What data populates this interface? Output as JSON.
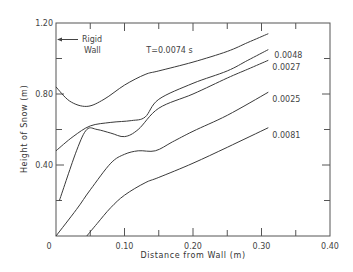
{
  "chart_data": {
    "type": "line",
    "title": "",
    "xlabel": "Distance from Wall (m)",
    "ylabel": "Height of Snow (m)",
    "xlim": [
      0,
      0.4
    ],
    "ylim": [
      0,
      1.2
    ],
    "x_ticks": [
      0,
      0.1,
      0.2,
      0.3,
      0.4
    ],
    "x_tick_labels": [
      "0",
      "0.10",
      "0.20",
      "0.30",
      "0.40"
    ],
    "x_minor_ticks": [
      0.05,
      0.15,
      0.25,
      0.35
    ],
    "y_ticks": [
      0.4,
      0.8,
      1.2
    ],
    "y_tick_labels": [
      "0.40",
      "0.80",
      "1.20"
    ],
    "y_minor_ticks": [
      0.2,
      0.6,
      1.0
    ],
    "grid": false,
    "annotations": [
      {
        "text_line1": "Rigid",
        "text_line2": "Wall",
        "arrow": "left",
        "points_to": "y-axis"
      }
    ],
    "series": [
      {
        "name": "T=0.0074 s",
        "label": "T=0.0074 s",
        "x": [
          0,
          0.02,
          0.045,
          0.07,
          0.1,
          0.13,
          0.15,
          0.2,
          0.25,
          0.28,
          0.31
        ],
        "y": [
          0.84,
          0.76,
          0.73,
          0.77,
          0.85,
          0.91,
          0.93,
          0.98,
          1.04,
          1.09,
          1.14
        ]
      },
      {
        "name": "0.0048",
        "label": "0.0048",
        "x": [
          0,
          0.025,
          0.05,
          0.08,
          0.11,
          0.13,
          0.15,
          0.2,
          0.25,
          0.28,
          0.31
        ],
        "y": [
          0.48,
          0.56,
          0.62,
          0.64,
          0.65,
          0.67,
          0.77,
          0.86,
          0.93,
          0.99,
          1.05
        ]
      },
      {
        "name": "0.0027",
        "label": "0.0027",
        "x": [
          0.005,
          0.03,
          0.045,
          0.06,
          0.08,
          0.1,
          0.12,
          0.15,
          0.2,
          0.25,
          0.28,
          0.31
        ],
        "y": [
          0.2,
          0.48,
          0.6,
          0.6,
          0.58,
          0.56,
          0.6,
          0.72,
          0.8,
          0.89,
          0.94,
          0.99
        ]
      },
      {
        "name": "0.0025",
        "label": "0.0025",
        "x": [
          0,
          0.03,
          0.05,
          0.08,
          0.1,
          0.12,
          0.145,
          0.17,
          0.2,
          0.25,
          0.31
        ],
        "y": [
          0.0,
          0.15,
          0.26,
          0.41,
          0.46,
          0.48,
          0.48,
          0.53,
          0.59,
          0.68,
          0.81
        ]
      },
      {
        "name": "0.0081",
        "label": "0.0081",
        "x": [
          0.045,
          0.06,
          0.08,
          0.1,
          0.13,
          0.15,
          0.2,
          0.25,
          0.31
        ],
        "y": [
          0.0,
          0.07,
          0.16,
          0.23,
          0.3,
          0.33,
          0.41,
          0.5,
          0.61
        ]
      }
    ]
  }
}
